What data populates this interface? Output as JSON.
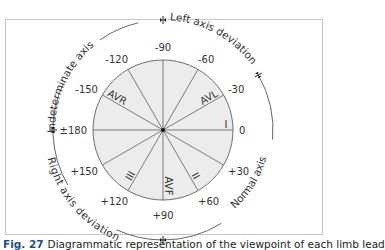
{
  "diagram": {
    "center": {
      "x": 163,
      "y": 130
    },
    "inner_radius": 70,
    "outer_radius": 113,
    "colors": {
      "circle_fill": "#ececec",
      "line": "#6e6e6e",
      "text": "#333333",
      "frame": "#c8c8c8",
      "caption_accent": "#1a4e8c"
    },
    "degree_labels": [
      {
        "angle": -90,
        "text": "-90"
      },
      {
        "angle": -60,
        "text": "-60"
      },
      {
        "angle": -30,
        "text": "-30"
      },
      {
        "angle": 0,
        "text": "0"
      },
      {
        "angle": 30,
        "text": "+30"
      },
      {
        "angle": 60,
        "text": "+60"
      },
      {
        "angle": 90,
        "text": "+90"
      },
      {
        "angle": 120,
        "text": "+120"
      },
      {
        "angle": 150,
        "text": "+150"
      },
      {
        "angle": 180,
        "text": "±180"
      },
      {
        "angle": -150,
        "text": "-150"
      },
      {
        "angle": -120,
        "text": "-120"
      }
    ],
    "lead_labels": [
      {
        "angle": 0,
        "text": "I"
      },
      {
        "angle": 60,
        "text": "II"
      },
      {
        "angle": 120,
        "text": "III"
      },
      {
        "angle": -150,
        "text": "AVR"
      },
      {
        "angle": -30,
        "text": "AVL"
      },
      {
        "angle": 90,
        "text": "AVF"
      }
    ],
    "axis_regions": [
      {
        "name": "Left axis deviation",
        "from": -90,
        "to": -30
      },
      {
        "name": "Normal axis",
        "from": -30,
        "to": 90
      },
      {
        "name": "Right axis deviation",
        "from": 90,
        "to": 180
      },
      {
        "name": "Indeterminate axis",
        "from": -180,
        "to": -90
      }
    ],
    "axis_labels": {
      "left": "Left axis deviation",
      "normal": "Normal axis",
      "right": "Right axis deviation",
      "indeterminate": "Indeterminate axis"
    }
  },
  "caption": {
    "figure_number": "Fig. 27",
    "text": "Diagrammatic representation of the viewpoint of each limb lead"
  }
}
